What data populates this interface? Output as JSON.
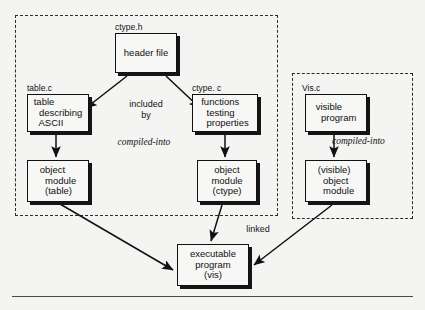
{
  "diagram": {
    "background_color": "#f4f4f3",
    "ink_color": "#111111",
    "groups": [
      {
        "id": "ctype-group",
        "style": "dashed",
        "x": 15,
        "y": 15,
        "w": 263,
        "h": 201
      },
      {
        "id": "vis-group",
        "style": "dashed",
        "x": 292,
        "y": 73,
        "w": 121,
        "h": 146
      }
    ],
    "captions": [
      {
        "id": "caption-ctype-h",
        "text": "ctype.h",
        "x": 115,
        "y": 23
      },
      {
        "id": "caption-table-c",
        "text": "table.c",
        "x": 27,
        "y": 84
      },
      {
        "id": "caption-ctype-c",
        "text": "ctype. c",
        "x": 192,
        "y": 84
      },
      {
        "id": "caption-vis-c",
        "text": "Vis.c",
        "x": 302,
        "y": 84
      }
    ],
    "nodes": [
      {
        "id": "header-file",
        "text": "header file",
        "align": "center",
        "x": 115,
        "y": 33,
        "w": 62,
        "h": 40
      },
      {
        "id": "table-describing-ascii",
        "text": "table\n  describing\n  ASCII",
        "align": "left",
        "x": 27,
        "y": 94,
        "w": 62,
        "h": 38
      },
      {
        "id": "functions-testing-properties",
        "text": "functions\n  testing\n  properties",
        "align": "left",
        "x": 192,
        "y": 94,
        "w": 66,
        "h": 38
      },
      {
        "id": "visible-program",
        "text": "visible\n  program",
        "align": "left",
        "x": 305,
        "y": 94,
        "w": 62,
        "h": 38
      },
      {
        "id": "object-module-table",
        "text": "object\n  module\n  (table)",
        "align": "left",
        "x": 27,
        "y": 160,
        "w": 62,
        "h": 42
      },
      {
        "id": "object-module-ctype",
        "text": "object\nmodule\n(ctype)",
        "align": "center",
        "x": 197,
        "y": 160,
        "w": 60,
        "h": 42
      },
      {
        "id": "visible-object-module",
        "text": "(visible)\n  object\n  module",
        "align": "left",
        "x": 305,
        "y": 160,
        "w": 62,
        "h": 42
      },
      {
        "id": "executable-program-vis",
        "text": "executable\nprogram\n(vis)",
        "align": "center",
        "x": 177,
        "y": 244,
        "w": 72,
        "h": 42
      }
    ],
    "edge_labels": [
      {
        "id": "label-included-by",
        "text": "included\nby",
        "style": "plain",
        "x": 116,
        "y": 99,
        "w": 60
      },
      {
        "id": "label-compiled-into-left",
        "text": "compiled-into",
        "style": "italic",
        "x": 94,
        "y": 137,
        "w": 100
      },
      {
        "id": "label-compiled-into-right",
        "text": "compiled-into",
        "style": "italic",
        "x": 332,
        "y": 136,
        "w": 90
      },
      {
        "id": "label-linked",
        "text": "linked",
        "style": "plain",
        "x": 238,
        "y": 224,
        "w": 40
      }
    ],
    "arrows": [
      {
        "id": "arrow-header-to-table",
        "from": "header-file",
        "to": "table-describing-ascii",
        "x1": 127,
        "y1": 76,
        "x2": 86,
        "y2": 108
      },
      {
        "id": "arrow-header-to-functions",
        "from": "header-file",
        "to": "functions-testing-properties",
        "x1": 166,
        "y1": 76,
        "x2": 200,
        "y2": 108
      },
      {
        "id": "arrow-table-to-object-table",
        "from": "table-describing-ascii",
        "to": "object-module-table",
        "x1": 56,
        "y1": 135,
        "x2": 56,
        "y2": 157
      },
      {
        "id": "arrow-functions-to-object-ctype",
        "from": "functions-testing-properties",
        "to": "object-module-ctype",
        "x1": 225,
        "y1": 135,
        "x2": 225,
        "y2": 157
      },
      {
        "id": "arrow-visible-to-visible-object",
        "from": "visible-program",
        "to": "visible-object-module",
        "x1": 334,
        "y1": 135,
        "x2": 334,
        "y2": 157
      },
      {
        "id": "arrow-object-table-to-executable",
        "from": "object-module-table",
        "to": "executable-program-vis",
        "x1": 60,
        "y1": 204,
        "x2": 173,
        "y2": 270
      },
      {
        "id": "arrow-object-ctype-to-executable",
        "from": "object-module-ctype",
        "to": "executable-program-vis",
        "x1": 222,
        "y1": 205,
        "x2": 211,
        "y2": 241
      },
      {
        "id": "arrow-visible-object-to-executable",
        "from": "visible-object-module",
        "to": "executable-program-vis",
        "x1": 332,
        "y1": 205,
        "x2": 254,
        "y2": 265
      }
    ],
    "bottom_rule": {
      "id": "bottom-rule",
      "x": 12,
      "y": 296,
      "w": 401
    }
  }
}
